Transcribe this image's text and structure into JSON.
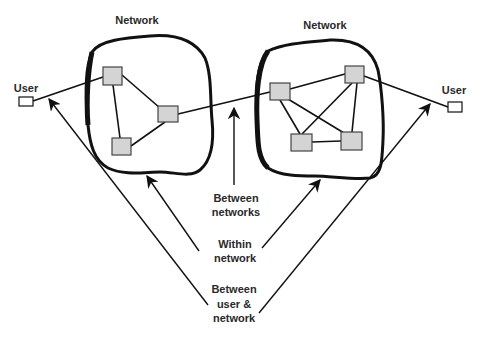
{
  "diagram": {
    "colors": {
      "stroke": "#111111",
      "node_fill": "#d4d4d4",
      "node_stroke": "#444444",
      "text": "#2a2a2a",
      "background": "#ffffff"
    },
    "networks": [
      {
        "label": "Network",
        "nodes": [
          {
            "id": "L1",
            "x": 103,
            "y": 67,
            "w": 19,
            "h": 18
          },
          {
            "id": "L2",
            "x": 158,
            "y": 106,
            "w": 20,
            "h": 16
          },
          {
            "id": "L3",
            "x": 112,
            "y": 138,
            "w": 19,
            "h": 17
          }
        ],
        "links": [
          [
            "L1",
            "L2"
          ],
          [
            "L1",
            "L3"
          ],
          [
            "L2",
            "L3"
          ]
        ]
      },
      {
        "label": "Network",
        "nodes": [
          {
            "id": "R1",
            "x": 270,
            "y": 83,
            "w": 20,
            "h": 17
          },
          {
            "id": "R2",
            "x": 345,
            "y": 66,
            "w": 19,
            "h": 17
          },
          {
            "id": "R3",
            "x": 291,
            "y": 134,
            "w": 21,
            "h": 17
          },
          {
            "id": "R4",
            "x": 341,
            "y": 132,
            "w": 21,
            "h": 18
          }
        ],
        "links": [
          [
            "R1",
            "R2"
          ],
          [
            "R1",
            "R3"
          ],
          [
            "R1",
            "R4"
          ],
          [
            "R2",
            "R3"
          ],
          [
            "R2",
            "R4"
          ],
          [
            "R3",
            "R4"
          ]
        ]
      }
    ],
    "users": [
      {
        "label": "User",
        "side": "left"
      },
      {
        "label": "User",
        "side": "right"
      }
    ],
    "annotations": {
      "between_networks": [
        "Between",
        "networks"
      ],
      "within_network": [
        "Within",
        "network"
      ],
      "between_user_network": [
        "Between",
        "user &",
        "network"
      ]
    }
  }
}
